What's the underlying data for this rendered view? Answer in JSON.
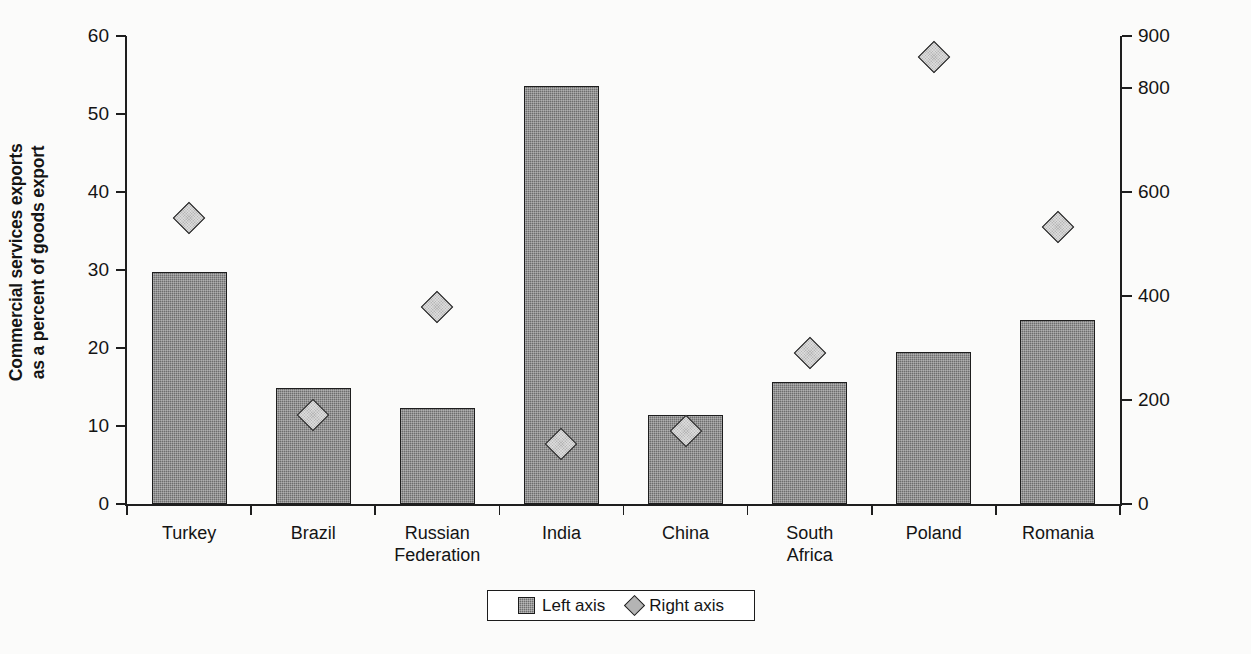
{
  "chart_data": {
    "type": "bar",
    "title": "",
    "subtitle": "",
    "xlabel": "",
    "ylabel": "Commercial services exports\nas a percent of goods export",
    "y2label": "Per capita exports of commercial services (dollar)",
    "grid": false,
    "legend_position": "bottom",
    "ylim": [
      0,
      60
    ],
    "y2lim": [
      0,
      900
    ],
    "yticks": [
      "0",
      "10",
      "20",
      "30",
      "40",
      "50",
      "60"
    ],
    "ytick_values": [
      0,
      10,
      20,
      30,
      40,
      50,
      60
    ],
    "y2ticks": [
      "0",
      "200",
      "400",
      "600",
      "800",
      "900"
    ],
    "y2tick_values": [
      0,
      200,
      400,
      600,
      800,
      900
    ],
    "categories": [
      "Turkey",
      "Brazil",
      "Russian\nFederation",
      "India",
      "China",
      "South\nAfrica",
      "Poland",
      "Romania"
    ],
    "series": [
      {
        "name": "Left axis",
        "axis": "left",
        "marker": "bar",
        "values": [
          29.7,
          14.9,
          12.3,
          53.6,
          11.4,
          15.7,
          19.5,
          23.6
        ]
      },
      {
        "name": "Right axis",
        "axis": "right",
        "marker": "diamond",
        "values": [
          550,
          172,
          378,
          115,
          141,
          290,
          860,
          532
        ]
      }
    ],
    "colors": {
      "bar_fill": "#6e6e6e",
      "bar_stroke": "#1e1e1e",
      "marker_fill": "#b6b6b6",
      "marker_stroke": "#1e1e1e",
      "axis": "#1e1e1e",
      "text": "#141414",
      "background": "#fbfbfa"
    }
  },
  "legend": {
    "items": [
      {
        "label": "Left axis",
        "marker": "square"
      },
      {
        "label": "Right axis",
        "marker": "diamond"
      }
    ]
  }
}
